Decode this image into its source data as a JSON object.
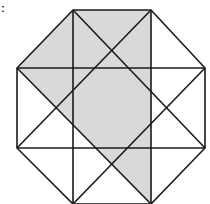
{
  "figure": {
    "label": ":",
    "colors": {
      "background": "#ffffff",
      "shade": "#d9d9d9",
      "stroke": "#1a1a1a"
    },
    "octagon_vertices": [
      [
        73,
        10
      ],
      [
        151,
        10
      ],
      [
        205,
        68
      ],
      [
        205,
        148
      ],
      [
        151,
        204
      ],
      [
        73,
        204
      ],
      [
        17,
        148
      ],
      [
        17,
        68
      ]
    ],
    "horizontal_lines_y": [
      68,
      148
    ],
    "vertical_lines_x": [
      73,
      151
    ],
    "diagonals": [
      [
        [
          73,
          10
        ],
        [
          205,
          148
        ]
      ],
      [
        [
          151,
          10
        ],
        [
          17,
          148
        ]
      ],
      [
        [
          17,
          68
        ],
        [
          151,
          204
        ]
      ],
      [
        [
          205,
          68
        ],
        [
          73,
          204
        ]
      ]
    ]
  }
}
